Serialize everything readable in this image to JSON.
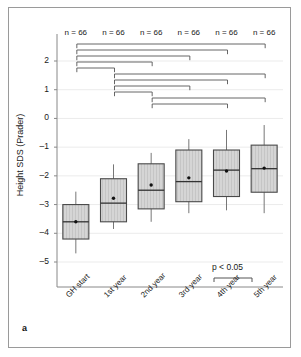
{
  "figure": {
    "panel_label": "a",
    "p_legend": "p < 0.05"
  },
  "chart_data": {
    "type": "box",
    "title": "",
    "xlabel": "",
    "ylabel": "Height SDS (Prader)",
    "categories": [
      "GH start",
      "1st year",
      "2nd year",
      "3rd year",
      "4th year",
      "5th year"
    ],
    "ylim": [
      -5.8,
      2.6
    ],
    "yticks": [
      2,
      1,
      0,
      -1,
      -2,
      -3,
      -4,
      -5
    ],
    "ytick_labels": [
      "2",
      "1",
      "0",
      "–1",
      "–2",
      "–3",
      "–4",
      "–5"
    ],
    "grid": true,
    "legend": "",
    "n_labels": [
      "n = 66",
      "n = 66",
      "n = 66",
      "n = 66",
      "n = 66",
      "n = 66"
    ],
    "n_values": [
      66,
      66,
      66,
      66,
      66,
      66
    ],
    "boxes": [
      {
        "category": "GH start",
        "whisker_low": -4.7,
        "q1": -4.2,
        "median": -3.6,
        "mean": -3.6,
        "q3": -3.0,
        "whisker_high": -2.55
      },
      {
        "category": "1st year",
        "whisker_low": -3.85,
        "q1": -3.6,
        "median": -2.95,
        "mean": -2.78,
        "q3": -2.1,
        "whisker_high": -1.6
      },
      {
        "category": "2nd year",
        "whisker_low": -3.6,
        "q1": -3.15,
        "median": -2.5,
        "mean": -2.32,
        "q3": -1.58,
        "whisker_high": -1.2
      },
      {
        "category": "3rd year",
        "whisker_low": -3.3,
        "q1": -2.9,
        "median": -2.2,
        "mean": -2.07,
        "q3": -1.1,
        "whisker_high": -0.72
      },
      {
        "category": "4th year",
        "whisker_low": -3.2,
        "q1": -2.72,
        "median": -1.8,
        "mean": -1.83,
        "q3": -1.1,
        "whisker_high": -0.4
      },
      {
        "category": "5th year",
        "whisker_low": -3.3,
        "q1": -2.57,
        "median": -1.75,
        "mean": -1.73,
        "q3": -0.93,
        "whisker_high": -0.23
      }
    ],
    "significance_brackets": [
      {
        "from": 0,
        "to": 5,
        "level": 0
      },
      {
        "from": 0,
        "to": 4,
        "level": 1
      },
      {
        "from": 0,
        "to": 3,
        "level": 2
      },
      {
        "from": 0,
        "to": 2,
        "level": 3
      },
      {
        "from": 0,
        "to": 1,
        "level": 4
      },
      {
        "from": 1,
        "to": 5,
        "level": 5
      },
      {
        "from": 1,
        "to": 4,
        "level": 6
      },
      {
        "from": 1,
        "to": 3,
        "level": 7
      },
      {
        "from": 1,
        "to": 2,
        "level": 8
      },
      {
        "from": 2,
        "to": 5,
        "level": 9
      },
      {
        "from": 2,
        "to": 4,
        "level": 10
      }
    ],
    "colors": {
      "box_fill": "#d5d5d5",
      "box_edge": "#4a4a4a",
      "median": "#333333",
      "mean_dot": "#111111",
      "whisker": "#777777",
      "grid": "#ebebeb",
      "axis": "#888888",
      "bracket": "#555555",
      "frame": "#9a9a9a"
    }
  }
}
